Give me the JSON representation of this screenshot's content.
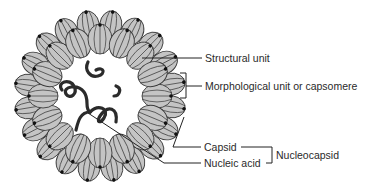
{
  "diagram": {
    "colors": {
      "capsomere_fill": "#c4c4c4",
      "outline": "#3a3a3a",
      "nucleic_acid": "#2b2b2b",
      "dot": "#111111",
      "text": "#2a2a2a"
    },
    "labels": {
      "structural_unit": "Structural unit",
      "morphological_unit": "Morphological unit or capsomere",
      "capsid": "Capsid",
      "nucleic_acid": "Nucleic acid",
      "nucleocapsid": "Nucleocapsid"
    }
  }
}
